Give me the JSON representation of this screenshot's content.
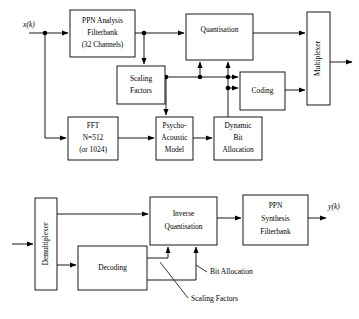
{
  "diagram": {
    "colors": {
      "stroke": "#000000",
      "background": "#ffffff",
      "box_fill": "#ffffff"
    },
    "encoder": {
      "input_label": "x(k)",
      "blocks": [
        {
          "id": "ppn-analysis-filterbank",
          "lines": [
            "PPN Analysis",
            "Filterbank",
            "(32 Channels)"
          ],
          "line1": "PPN Analysis",
          "line2": "Filterbank",
          "line3": "(32 Channels)"
        },
        {
          "id": "quantisation",
          "line1": "Quantisation"
        },
        {
          "id": "multiplexer",
          "line1": "Multiplexer"
        },
        {
          "id": "scaling-factors",
          "line1": "Scaling",
          "line2": "Factors"
        },
        {
          "id": "coding",
          "line1": "Coding"
        },
        {
          "id": "fft",
          "line1": "FFT",
          "line2": "N=512",
          "line3": "(or 1024)"
        },
        {
          "id": "psycho-acoustic-model",
          "line1": "Psycho-",
          "line2": "Acoustic",
          "line3": "Model"
        },
        {
          "id": "dynamic-bit-allocation",
          "line1": "Dynamic",
          "line2": "Bit",
          "line3": "Allocation"
        }
      ]
    },
    "decoder": {
      "output_label": "y(k)",
      "blocks": [
        {
          "id": "demultiplexer",
          "line1": "Demultiplexer"
        },
        {
          "id": "inverse-quantisation",
          "line1": "Inverse",
          "line2": "Quantisation"
        },
        {
          "id": "ppn-synthesis-filterbank",
          "line1": "PPN",
          "line2": "Synthesis",
          "line3": "Filterbank"
        },
        {
          "id": "decoding",
          "line1": "Decoding"
        }
      ],
      "annotations": [
        {
          "id": "bit-allocation",
          "label": "Bit Allocation"
        },
        {
          "id": "scaling-factors",
          "label": "Scaling Factors"
        }
      ]
    }
  }
}
